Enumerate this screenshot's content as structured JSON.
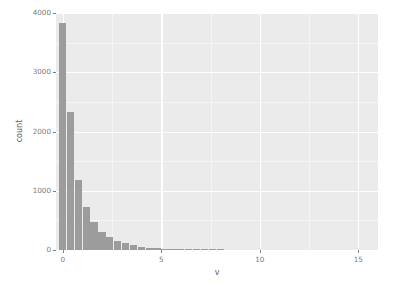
{
  "chart_data": {
    "type": "bar",
    "title": "",
    "subtitle": "",
    "xlabel": "v",
    "ylabel": "count",
    "xlim": [
      -0.35,
      16.0
    ],
    "ylim": [
      0,
      4000
    ],
    "grid": true,
    "legend": null,
    "binwidth": 0.4,
    "x": [
      0.0,
      0.4,
      0.8,
      1.2,
      1.6,
      2.0,
      2.4,
      2.8,
      3.2,
      3.6,
      4.0,
      4.4,
      4.8,
      5.2,
      5.6,
      6.0,
      6.4,
      6.8,
      7.2,
      7.6,
      8.0
    ],
    "values": [
      3830,
      2330,
      1190,
      720,
      470,
      310,
      220,
      155,
      110,
      80,
      55,
      42,
      30,
      22,
      16,
      11,
      8,
      6,
      4,
      3,
      2
    ],
    "categories": [
      "0.0",
      "0.4",
      "0.8",
      "1.2",
      "1.6",
      "2.0",
      "2.4",
      "2.8",
      "3.2",
      "3.6",
      "4.0",
      "4.4",
      "4.8",
      "5.2",
      "5.6",
      "6.0",
      "6.4",
      "6.8",
      "7.2",
      "7.6",
      "8.0"
    ],
    "y_ticks": [
      0,
      1000,
      2000,
      3000,
      4000
    ],
    "y_tick_labels": [
      "0",
      "1000",
      "2000",
      "3000",
      "4000"
    ],
    "y_minor_ticks": [
      500,
      1500,
      2500,
      3500
    ],
    "x_ticks": [
      0,
      5,
      10,
      15
    ],
    "x_tick_labels": [
      "0",
      "5",
      "10",
      "15"
    ],
    "x_minor_ticks": [
      2.5,
      7.5,
      12.5
    ],
    "colors": {
      "panel_background": "#ebebeb",
      "plot_background": "#ffffff",
      "bar_fill": "#9c9c9c",
      "grid_major": "#ffffff",
      "grid_minor": "#f5f5f5",
      "axis_text": "#7a7a7a",
      "axis_title": "#5e5e5e",
      "tick_mark": "#7f7f7f"
    }
  }
}
